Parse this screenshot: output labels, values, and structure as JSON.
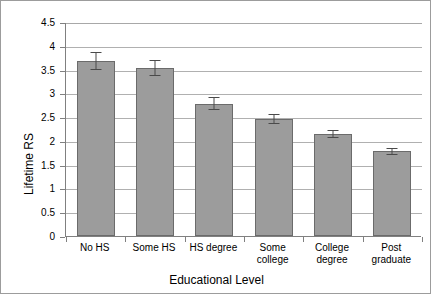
{
  "chart_data": {
    "type": "bar",
    "title": "",
    "xlabel": "Educational Level",
    "ylabel": "Lifetime RS",
    "categories": [
      "No HS",
      "Some HS",
      "HS degree",
      "Some\ncollege",
      "College\ndegree",
      "Post\ngraduate"
    ],
    "values": [
      3.68,
      3.54,
      2.78,
      2.46,
      2.14,
      1.78
    ],
    "errors": [
      0.18,
      0.17,
      0.14,
      0.1,
      0.09,
      0.07
    ],
    "ylim": [
      0,
      4.5
    ],
    "ytick_labels": [
      "0",
      "0.5",
      "1",
      "1.5",
      "2",
      "2.5",
      "3",
      "3.5",
      "4",
      "4.5"
    ],
    "ytick_values": [
      0,
      0.5,
      1,
      1.5,
      2,
      2.5,
      3,
      3.5,
      4,
      4.5
    ],
    "grid": true,
    "legend": false,
    "bar_color": "#9c9c9c",
    "bar_border_color": "#6b6b6b",
    "gridline_color": "#b0b0b0",
    "axis_color": "#808080",
    "errorbar_color": "#4a4a4a"
  }
}
